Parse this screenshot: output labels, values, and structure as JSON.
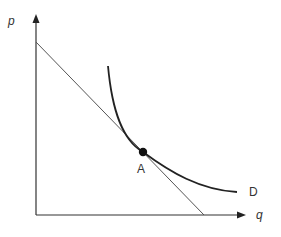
{
  "diagram": {
    "y_axis_label": "p",
    "x_axis_label": "q",
    "curve_label": "D",
    "point_label": "A",
    "elements": [
      {
        "type": "axis",
        "name": "price axis",
        "label": "p"
      },
      {
        "type": "axis",
        "name": "quantity axis",
        "label": "q"
      },
      {
        "type": "line",
        "name": "tangent straight line"
      },
      {
        "type": "curve",
        "name": "demand curve",
        "label": "D"
      },
      {
        "type": "point",
        "name": "tangency point",
        "label": "A"
      }
    ],
    "colors": {
      "axes": "#333333",
      "tangent": "#555555",
      "curve": "#222222",
      "point": "#111111"
    }
  }
}
